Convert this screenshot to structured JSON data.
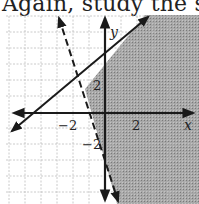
{
  "caption": "Again, study the s",
  "graph": {
    "x_axis_label": "x",
    "y_axis_label": "y",
    "tick_labels": {
      "x_neg": "−2",
      "x_pos": "2",
      "y_pos": "2",
      "y_neg": "−2"
    },
    "lines": [
      {
        "name": "solid boundary",
        "equation": "y = x + 3",
        "style": "solid"
      },
      {
        "name": "dashed boundary",
        "equation": "y = -3x - 2",
        "style": "dashed"
      }
    ],
    "shaded_region": "y <= x + 3 and y > -3x - 2",
    "colors": {
      "shade": "#9a9a9a",
      "grid": "#bdbdbd",
      "line": "#1a1a1a"
    }
  }
}
